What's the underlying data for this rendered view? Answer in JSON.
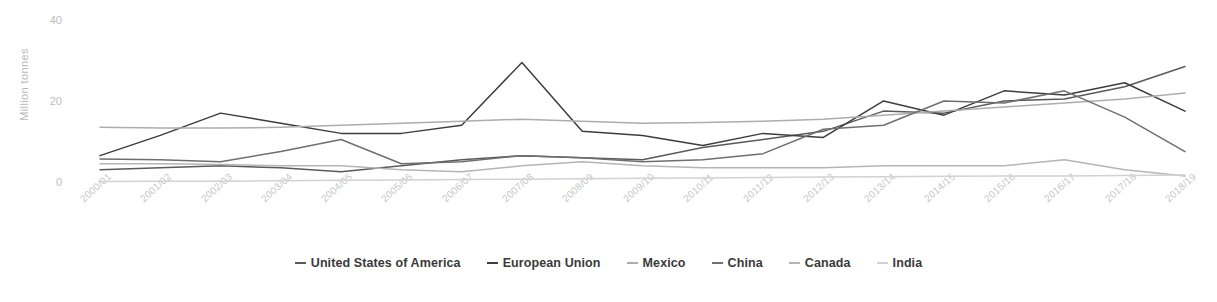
{
  "chart_data": {
    "type": "line",
    "title": "",
    "xlabel": "",
    "ylabel": "Million tonnes",
    "ylim": [
      0,
      40
    ],
    "yticks": [
      0,
      20,
      40
    ],
    "grid": false,
    "legend_position": "bottom",
    "categories": [
      "2000/01",
      "2001/02",
      "2002/03",
      "2003/04",
      "2004/05",
      "2005/06",
      "2006/07",
      "2007/08",
      "2008/09",
      "2009/10",
      "2010/11",
      "2011/12",
      "2012/13",
      "2013/14",
      "2014/15",
      "2015/16",
      "2016/17",
      "2017/18",
      "2018/19"
    ],
    "series": [
      {
        "name": "United States of America",
        "color": "#5a5a5a",
        "values": [
          3.5,
          4.0,
          4.5,
          4.0,
          3.0,
          4.5,
          6.0,
          7.0,
          6.5,
          6.0,
          9.0,
          11.0,
          13.0,
          18.0,
          17.5,
          20.5,
          21.0,
          24.0,
          29.0
        ]
      },
      {
        "name": "European Union",
        "color": "#3d3d3d",
        "values": [
          7.0,
          12.0,
          17.5,
          15.0,
          12.5,
          12.5,
          14.5,
          30.0,
          13.0,
          12.0,
          9.5,
          12.5,
          11.5,
          20.5,
          17.0,
          23.0,
          22.0,
          25.0,
          18.0
        ]
      },
      {
        "name": "Mexico",
        "color": "#adadad",
        "values": [
          14.0,
          13.8,
          13.8,
          14.0,
          14.5,
          15.0,
          15.5,
          16.0,
          15.5,
          15.0,
          15.2,
          15.5,
          16.0,
          17.0,
          18.0,
          19.0,
          20.0,
          21.0,
          22.5
        ]
      },
      {
        "name": "China",
        "color": "#6f6f6f",
        "values": [
          6.2,
          6.0,
          5.5,
          8.0,
          11.0,
          5.0,
          5.5,
          7.0,
          6.5,
          5.5,
          6.0,
          7.5,
          13.5,
          14.5,
          20.5,
          20.0,
          23.0,
          16.5,
          8.0
        ]
      },
      {
        "name": "Canada",
        "color": "#b5b5b5",
        "values": [
          5.0,
          5.0,
          4.8,
          4.5,
          4.5,
          3.5,
          3.0,
          4.5,
          5.5,
          4.5,
          4.0,
          4.0,
          4.0,
          4.5,
          4.5,
          4.5,
          6.0,
          3.5,
          2.0
        ]
      },
      {
        "name": "India",
        "color": "#d2d2d2",
        "values": [
          0.6,
          0.7,
          0.7,
          0.8,
          0.9,
          1.0,
          1.1,
          1.2,
          1.3,
          1.4,
          1.5,
          1.6,
          1.7,
          1.8,
          1.9,
          2.0,
          2.0,
          2.1,
          2.2
        ]
      }
    ]
  }
}
